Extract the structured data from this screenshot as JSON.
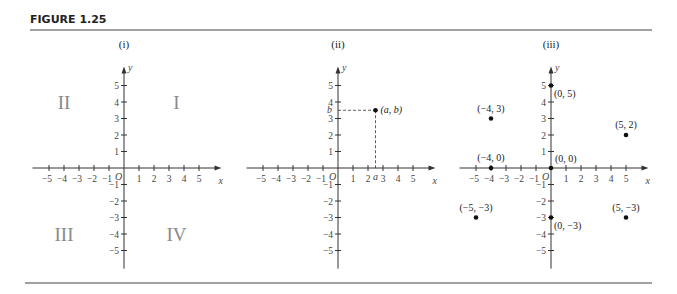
{
  "figure": {
    "title": "FIGURE 1.25"
  },
  "chart_data": [
    {
      "type": "scatter",
      "panel": "(i)",
      "title": "(i)",
      "xlabel": "x",
      "ylabel": "y",
      "origin_label": "O",
      "xlim": [
        -5,
        5
      ],
      "ylim": [
        -5,
        5
      ],
      "x_ticks": [
        -5,
        -4,
        -3,
        -2,
        -1,
        1,
        2,
        3,
        4,
        5
      ],
      "y_ticks": [
        -5,
        -4,
        -3,
        -2,
        -1,
        1,
        2,
        3,
        4,
        5
      ],
      "quadrant_labels": [
        {
          "label": "I",
          "x": 3.5,
          "y": 4
        },
        {
          "label": "II",
          "x": -4,
          "y": 4
        },
        {
          "label": "III",
          "x": -4,
          "y": -4
        },
        {
          "label": "IV",
          "x": 3.5,
          "y": -4
        }
      ],
      "points": []
    },
    {
      "type": "scatter",
      "panel": "(ii)",
      "title": "(ii)",
      "xlabel": "x",
      "ylabel": "y",
      "origin_label": "O",
      "xlim": [
        -5,
        5
      ],
      "ylim": [
        -5,
        5
      ],
      "x_ticks": [
        -5,
        -4,
        -3,
        -2,
        -1,
        1,
        2,
        3,
        4,
        5
      ],
      "y_ticks": [
        -5,
        -4,
        -3,
        -2,
        -1,
        1,
        2,
        3,
        4,
        5
      ],
      "points": [
        {
          "label": "(a, b)",
          "x": 2.5,
          "y": 3.5,
          "dashed_projections": true,
          "x_axis_label": "a",
          "y_axis_label": "b"
        }
      ]
    },
    {
      "type": "scatter",
      "panel": "(iii)",
      "title": "(iii)",
      "xlabel": "x",
      "ylabel": "y",
      "origin_label": "O",
      "xlim": [
        -5,
        5
      ],
      "ylim": [
        -5,
        5
      ],
      "x_ticks": [
        -5,
        -4,
        -3,
        -2,
        -1,
        1,
        2,
        3,
        4,
        5
      ],
      "y_ticks": [
        -5,
        -4,
        -3,
        -2,
        -1,
        1,
        2,
        3,
        4,
        5
      ],
      "points": [
        {
          "label": "(0, 5)",
          "x": 0,
          "y": 5,
          "label_pos": "below-right"
        },
        {
          "label": "(-4, 3)",
          "x": -4,
          "y": 3,
          "label_pos": "above"
        },
        {
          "label": "(5, 2)",
          "x": 5,
          "y": 2,
          "label_pos": "above"
        },
        {
          "label": "(-4, 0)",
          "x": -4,
          "y": 0,
          "label_pos": "above"
        },
        {
          "label": "(0, 0)",
          "x": 0,
          "y": 0,
          "label_pos": "above-right"
        },
        {
          "label": "(-5, -3)",
          "x": -5,
          "y": -3,
          "label_pos": "above"
        },
        {
          "label": "(0, -3)",
          "x": 0,
          "y": -3,
          "label_pos": "below-right"
        },
        {
          "label": "(5, -3)",
          "x": 5,
          "y": -3,
          "label_pos": "above"
        }
      ]
    }
  ],
  "layout": {
    "panel_origins": [
      [
        124,
        168
      ],
      [
        338,
        168
      ],
      [
        551,
        168
      ]
    ],
    "x_unit_px": 15,
    "y_unit_px": 16.5
  }
}
